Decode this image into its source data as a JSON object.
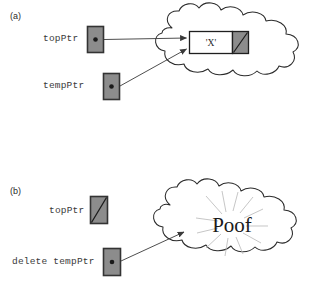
{
  "figure": {
    "caption": "",
    "colors": {
      "box_fill": "#8c8c8c",
      "box_border": "#333333",
      "node_fill": "#ffffff",
      "node_null_fill": "#8c8c8c",
      "stroke": "#3a3a3a",
      "text": "#3a3a3a",
      "cloud_stroke": "#2b2b2b",
      "burst_stroke": "#b9b9b9",
      "background": "#ffffff"
    }
  },
  "panels": [
    {
      "id": "a",
      "label": "(a)",
      "pointers": [
        {
          "name": "topPtr",
          "label": "topPtr",
          "state": "points-to-node",
          "icon": "pointer-dot-icon"
        },
        {
          "name": "tempPtr",
          "label": "tempPtr",
          "state": "points-to-node",
          "icon": "pointer-dot-icon"
        }
      ],
      "heap": {
        "name": "heap-cloud",
        "node": {
          "data_label": "'X'",
          "next_field": "null",
          "next_icon": "null-slash-icon"
        }
      },
      "arrows": [
        {
          "from": "topPtr",
          "to": "node"
        },
        {
          "from": "tempPtr",
          "to": "node"
        }
      ]
    },
    {
      "id": "b",
      "label": "(b)",
      "pointers": [
        {
          "name": "topPtr",
          "label": "topPtr",
          "state": "null",
          "icon": "null-slash-icon"
        },
        {
          "name": "tempPtr",
          "label": "delete tempPtr",
          "state": "points-to-heap",
          "icon": "pointer-dot-icon"
        }
      ],
      "heap": {
        "name": "heap-cloud",
        "effect_text": "Poof",
        "effect_icon": "burst-icon"
      },
      "arrows": [
        {
          "from": "delete tempPtr",
          "to": "heap"
        }
      ]
    }
  ]
}
